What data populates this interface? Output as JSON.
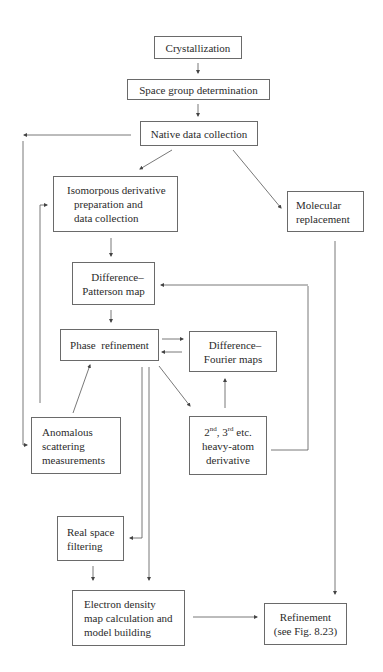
{
  "diagram": {
    "title": "",
    "nodes": {
      "crystallization": {
        "lines": [
          "Crystallization"
        ]
      },
      "space_group": {
        "lines": [
          "Space group determination"
        ]
      },
      "native": {
        "lines": [
          "Native data collection"
        ]
      },
      "isomorphous": {
        "lines": [
          "Isomorpous derivative",
          "preparation and",
          "data collection"
        ]
      },
      "molecular": {
        "lines": [
          "Molecular",
          "replacement"
        ]
      },
      "patterson": {
        "lines": [
          "Difference–",
          "Patterson map"
        ]
      },
      "phase": {
        "lines": [
          "Phase  refinement"
        ]
      },
      "fourier": {
        "lines": [
          "Difference–",
          "Fourier maps"
        ]
      },
      "anomalous": {
        "lines": [
          "Anomalous",
          "scattering",
          "measurements"
        ]
      },
      "heavy_atom": {
        "line1_a": "2",
        "line1_a_sup": "nd",
        "line1_b": ", 3",
        "line1_b_sup": "rd",
        "line1_c": " etc.",
        "lines": [
          "heavy-atom",
          "derivative"
        ]
      },
      "real_space": {
        "lines": [
          "Real space",
          "filtering"
        ]
      },
      "electron_density": {
        "lines": [
          "Electron density",
          "map calculation and",
          "model building"
        ]
      },
      "refinement": {
        "lines": [
          "Refinement",
          "(see Fig. 8.23)"
        ]
      }
    },
    "edges": [
      {
        "from": "Crystallization",
        "to": "Space group determination"
      },
      {
        "from": "Space group determination",
        "to": "Native data collection"
      },
      {
        "from": "Native data collection",
        "to": "Isomorpous derivative preparation and data collection"
      },
      {
        "from": "Native data collection",
        "to": "Molecular replacement"
      },
      {
        "from": "Native data collection",
        "to": "Anomalous scattering measurements"
      },
      {
        "from": "Isomorpous derivative preparation and data collection",
        "to": "Difference-Patterson map"
      },
      {
        "from": "Difference-Patterson map",
        "to": "Phase refinement"
      },
      {
        "from": "Phase refinement",
        "to": "Difference-Fourier maps"
      },
      {
        "from": "Difference-Fourier maps",
        "to": "Phase refinement"
      },
      {
        "from": "Phase refinement",
        "to": "2nd, 3rd etc. heavy-atom derivative"
      },
      {
        "from": "2nd, 3rd etc. heavy-atom derivative",
        "to": "Difference-Fourier maps"
      },
      {
        "from": "2nd, 3rd etc. heavy-atom derivative",
        "to": "Difference-Patterson map"
      },
      {
        "from": "Anomalous scattering measurements",
        "to": "Phase refinement"
      },
      {
        "from": "Anomalous scattering measurements",
        "to": "Isomorpous derivative preparation and data collection"
      },
      {
        "from": "Phase refinement",
        "to": "Real space filtering"
      },
      {
        "from": "Phase refinement",
        "to": "Electron density map calculation and model building"
      },
      {
        "from": "Real space filtering",
        "to": "Electron density map calculation and model building"
      },
      {
        "from": "Electron density map calculation and model building",
        "to": "Refinement (see Fig. 8.23)"
      },
      {
        "from": "Molecular replacement",
        "to": "Refinement (see Fig. 8.23)"
      }
    ]
  }
}
